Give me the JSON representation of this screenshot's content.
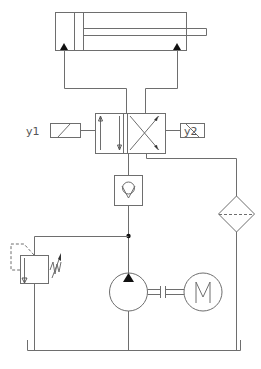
{
  "diagram": {
    "type": "hydraulic-circuit",
    "components": {
      "cylinder": {
        "name": "double-acting cylinder"
      },
      "valve": {
        "name": "4/2 directional valve",
        "solenoid_left_label": "y1",
        "solenoid_right_label": "y2"
      },
      "check_valve": {
        "name": "check valve"
      },
      "relief_valve": {
        "name": "pressure relief valve"
      },
      "pump": {
        "name": "hydraulic pump"
      },
      "motor": {
        "name": "electric motor",
        "symbol_text": "M"
      },
      "filter": {
        "name": "filter"
      },
      "tank": {
        "name": "tank"
      }
    }
  },
  "colors": {
    "line": "#6e6e6e",
    "dark": "#222222",
    "background": "#ffffff"
  }
}
